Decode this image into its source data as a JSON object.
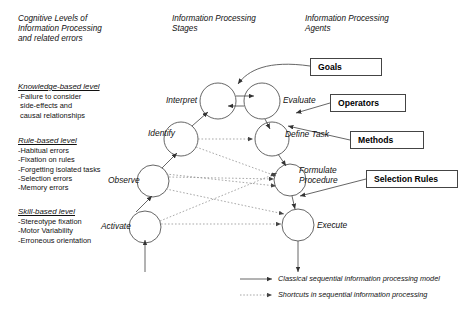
{
  "columns": {
    "cognitive": "Cognitive Levels of\nInformation Processing\nand related errors",
    "stages": "Information Processing\nStages",
    "agents": "Information Processing\nAgents"
  },
  "levels": [
    {
      "id": "knowledge",
      "title": "Knowledge-based level",
      "errors": "-Failure to consider\n side-effects and\n causal relationships"
    },
    {
      "id": "rule",
      "title": "Rule-based level",
      "errors": "-Habitual errors\n-Fixation on rules\n-Forgetting isolated tasks\n-Selection errors\n-Memory errors"
    },
    {
      "id": "skill",
      "title": "Skill-based level",
      "errors": "-Stereotype fixation\n-Motor Variability\n-Erroneous orientation"
    }
  ],
  "nodes": [
    {
      "id": "interpret",
      "label": "Interpret",
      "cx": 218,
      "cy": 101,
      "r": 18,
      "lx": 166,
      "ly": 96
    },
    {
      "id": "evaluate",
      "label": "Evaluate",
      "cx": 262,
      "cy": 101,
      "r": 18,
      "lx": 283,
      "ly": 96
    },
    {
      "id": "identify",
      "label": "Identify",
      "cx": 181,
      "cy": 139,
      "r": 17,
      "lx": 148,
      "ly": 129
    },
    {
      "id": "definetask",
      "label": "Define Task",
      "cx": 272,
      "cy": 139,
      "r": 17,
      "lx": 285,
      "ly": 130
    },
    {
      "id": "observe",
      "label": "Observe",
      "cx": 153,
      "cy": 181,
      "r": 16,
      "lx": 108,
      "ly": 176
    },
    {
      "id": "formulate",
      "label": "Formulate\nProcedure",
      "cx": 290,
      "cy": 180,
      "r": 16,
      "lx": 299,
      "ly": 166
    },
    {
      "id": "activate",
      "label": "Activate",
      "cx": 145,
      "cy": 227,
      "r": 16,
      "lx": 101,
      "ly": 222
    },
    {
      "id": "execute",
      "label": "Execute",
      "cx": 298,
      "cy": 225,
      "r": 16,
      "lx": 317,
      "ly": 221
    }
  ],
  "agent_boxes": [
    {
      "id": "goals",
      "label": "Goals",
      "x": 310,
      "y": 58,
      "w": 72,
      "h": 18
    },
    {
      "id": "operators",
      "label": "Operators",
      "x": 330,
      "y": 94,
      "w": 76,
      "h": 18
    },
    {
      "id": "methods",
      "label": "Methods",
      "x": 350,
      "y": 131,
      "w": 74,
      "h": 18
    },
    {
      "id": "selection_rules",
      "label": "Selection Rules",
      "x": 366,
      "y": 170,
      "w": 92,
      "h": 18
    }
  ],
  "legend": [
    {
      "id": "classical",
      "style": "solid",
      "label": "Classical sequential information processing model"
    },
    {
      "id": "shortcuts",
      "style": "dotted",
      "label": "Shortcuts in sequential information processing"
    }
  ],
  "colors": {
    "line": "#555555",
    "dotted": "#888888",
    "box_border": "#444444",
    "text": "#111111"
  }
}
